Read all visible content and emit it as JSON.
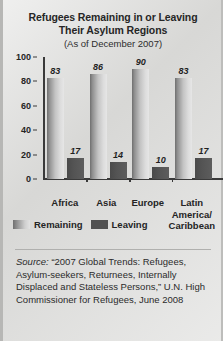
{
  "title": {
    "line1": "Refugees Remaining in or Leaving",
    "line2": "Their Asylum Regions",
    "subtitle": "(As of December 2007)"
  },
  "legend": {
    "remaining": "Remaining",
    "leaving": "Leaving"
  },
  "source": {
    "label": "Source:",
    "text": " “2007 Global Trends: Refugees, Asylum-seekers, Returnees, Internally Displaced and Stateless Persons,” U.N. High Commissioner for Refugees, June 2008"
  },
  "colors": {
    "background": "#dcdcda",
    "remaining_bar": "#c3c3c3",
    "leaving_bar": "#515151",
    "axis": "#3a3a3a",
    "text": "#242424"
  },
  "chart_data": {
    "type": "bar",
    "title": "Refugees Remaining in or Leaving Their Asylum Regions",
    "subtitle": "(As of December 2007)",
    "xlabel": "",
    "ylabel": "",
    "ylim": [
      0,
      100
    ],
    "yticks": [
      100,
      80,
      60,
      40,
      20,
      0
    ],
    "ytick_labels": [
      "100",
      "80",
      "60",
      "40",
      "20",
      "0"
    ],
    "grid": false,
    "legend_position": "bottom-left",
    "categories": [
      "Africa",
      "Asia",
      "Europe",
      "Latin America/ Caribbean"
    ],
    "category_lines": [
      [
        "Africa"
      ],
      [
        "Asia"
      ],
      [
        "Europe"
      ],
      [
        "Latin",
        "America/",
        "Caribbean"
      ]
    ],
    "series": [
      {
        "name": "Remaining",
        "values": [
          83,
          86,
          90,
          83
        ]
      },
      {
        "name": "Leaving",
        "values": [
          17,
          14,
          10,
          17
        ]
      }
    ]
  }
}
